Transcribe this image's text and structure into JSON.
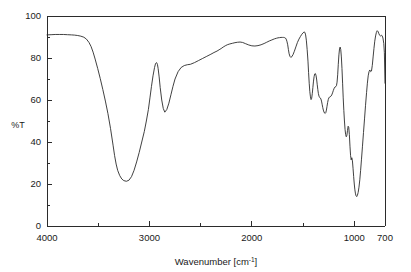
{
  "chart_data": {
    "type": "line",
    "title": "",
    "xlabel": "Wavenumber [cm⁻¹]",
    "ylabel": "%T",
    "xlabel_base": "Wavenumber [cm",
    "xlabel_sup": "-1",
    "xlabel_tail": "]",
    "xlim": [
      4000,
      700
    ],
    "ylim": [
      0,
      100
    ],
    "x_inverted": true,
    "grid": false,
    "legend": "none",
    "line_color": "#2b2b2b",
    "background_color": "#ffffff",
    "xticks": [
      4000,
      3000,
      2000,
      1000,
      700
    ],
    "xtick_labels": [
      "4000",
      "3000",
      "2000",
      "1000",
      "700"
    ],
    "x_minor_ticks": [
      3500,
      2500,
      1500
    ],
    "yticks": [
      0,
      20,
      40,
      60,
      80,
      100
    ],
    "ytick_labels": [
      "0",
      "20",
      "40",
      "60",
      "80",
      "100"
    ],
    "y_minor_ticks": [
      10,
      30,
      50,
      70,
      90
    ],
    "series": [
      {
        "name": "Transmittance",
        "x": [
          4000,
          3960,
          3920,
          3880,
          3840,
          3800,
          3760,
          3730,
          3700,
          3670,
          3640,
          3615,
          3590,
          3570,
          3550,
          3530,
          3505,
          3480,
          3455,
          3430,
          3405,
          3380,
          3355,
          3340,
          3325,
          3310,
          3290,
          3270,
          3250,
          3225,
          3200,
          3175,
          3150,
          3125,
          3100,
          3075,
          3050,
          3030,
          3010,
          2995,
          2980,
          2965,
          2950,
          2940,
          2930,
          2922,
          2915,
          2905,
          2895,
          2880,
          2865,
          2850,
          2830,
          2810,
          2790,
          2770,
          2750,
          2720,
          2690,
          2660,
          2630,
          2600,
          2560,
          2520,
          2480,
          2440,
          2400,
          2370,
          2340,
          2320,
          2300,
          2280,
          2260,
          2240,
          2215,
          2190,
          2165,
          2140,
          2115,
          2090,
          2060,
          2030,
          2000,
          1970,
          1940,
          1910,
          1880,
          1855,
          1830,
          1805,
          1780,
          1760,
          1745,
          1730,
          1715,
          1700,
          1690,
          1680,
          1672,
          1665,
          1658,
          1650,
          1643,
          1636,
          1628,
          1620,
          1610,
          1598,
          1585,
          1570,
          1555,
          1540,
          1525,
          1512,
          1500,
          1490,
          1482,
          1475,
          1468,
          1460,
          1452,
          1446,
          1440,
          1434,
          1428,
          1422,
          1416,
          1410,
          1404,
          1398,
          1392,
          1386,
          1380,
          1374,
          1368,
          1362,
          1356,
          1350,
          1344,
          1338,
          1332,
          1326,
          1320,
          1314,
          1308,
          1302,
          1296,
          1290,
          1284,
          1278,
          1272,
          1266,
          1260,
          1254,
          1248,
          1242,
          1236,
          1228,
          1220,
          1212,
          1204,
          1196,
          1188,
          1180,
          1174,
          1168,
          1162,
          1156,
          1150,
          1144,
          1138,
          1132,
          1126,
          1120,
          1114,
          1108,
          1102,
          1096,
          1090,
          1084,
          1078,
          1072,
          1066,
          1060,
          1054,
          1048,
          1042,
          1036,
          1030,
          1024,
          1018,
          1012,
          1006,
          1000,
          994,
          988,
          982,
          976,
          970,
          962,
          954,
          946,
          938,
          930,
          920,
          910,
          900,
          890,
          880,
          872,
          864,
          856,
          848,
          840,
          832,
          824,
          816,
          808,
          800,
          792,
          784,
          776,
          768,
          760,
          752,
          744,
          736,
          728,
          720,
          712,
          706,
          700
        ],
        "y": [
          91.0,
          91.1,
          91.2,
          91.2,
          91.2,
          91.1,
          91.0,
          90.9,
          90.7,
          90.4,
          89.9,
          89.0,
          87.4,
          85.5,
          82.8,
          79.5,
          75.0,
          70.2,
          65.0,
          59.5,
          53.5,
          46.5,
          38.5,
          33.5,
          29.5,
          26.5,
          24.0,
          22.4,
          21.6,
          21.3,
          21.8,
          23.5,
          26.5,
          30.5,
          35.0,
          40.0,
          45.0,
          50.0,
          55.5,
          61.0,
          66.5,
          71.5,
          75.5,
          77.4,
          77.8,
          77.0,
          75.0,
          71.0,
          66.0,
          60.0,
          56.0,
          54.2,
          55.5,
          58.5,
          62.5,
          66.5,
          70.0,
          73.5,
          75.5,
          76.4,
          76.8,
          77.0,
          77.8,
          78.8,
          79.8,
          80.8,
          81.8,
          82.6,
          83.3,
          83.9,
          84.5,
          85.2,
          85.8,
          86.3,
          86.7,
          87.0,
          87.3,
          87.5,
          87.6,
          87.4,
          86.8,
          86.2,
          85.8,
          85.7,
          85.9,
          86.3,
          86.9,
          87.5,
          88.1,
          88.6,
          89.1,
          89.4,
          89.6,
          89.7,
          89.8,
          89.8,
          89.8,
          89.7,
          89.5,
          89.0,
          88.0,
          86.3,
          84.0,
          82.0,
          80.8,
          80.3,
          80.6,
          81.6,
          83.2,
          85.3,
          87.4,
          89.0,
          90.3,
          91.3,
          92.0,
          92.4,
          92.2,
          91.0,
          88.5,
          84.0,
          78.5,
          73.0,
          68.0,
          64.0,
          61.5,
          60.2,
          60.8,
          63.0,
          66.0,
          69.0,
          71.2,
          72.4,
          72.6,
          71.8,
          70.0,
          67.5,
          65.0,
          63.0,
          61.8,
          61.2,
          61.0,
          60.5,
          59.5,
          58.0,
          56.5,
          55.2,
          54.3,
          53.8,
          53.6,
          54.0,
          55.2,
          57.0,
          58.8,
          60.2,
          61.0,
          61.4,
          61.5,
          61.8,
          62.4,
          63.4,
          64.6,
          65.6,
          66.2,
          66.4,
          66.8,
          68.5,
          72.0,
          77.0,
          81.5,
          84.3,
          85.2,
          84.0,
          80.5,
          75.0,
          68.0,
          61.0,
          55.0,
          50.0,
          46.0,
          43.5,
          42.5,
          43.2,
          45.5,
          47.5,
          47.0,
          43.5,
          38.0,
          33.5,
          31.5,
          32.5,
          31.0,
          27.5,
          23.5,
          20.0,
          17.2,
          15.3,
          14.3,
          14.0,
          14.5,
          16.0,
          18.5,
          22.0,
          26.5,
          31.5,
          38.0,
          44.5,
          51.0,
          57.5,
          63.5,
          68.0,
          71.5,
          73.5,
          74.3,
          73.5,
          73.8,
          76.5,
          80.5,
          84.5,
          88.0,
          90.5,
          92.2,
          93.0,
          92.6,
          91.6,
          90.8,
          90.5,
          90.8,
          90.6,
          89.5,
          87.0,
          82.5,
          68.0
        ]
      }
    ],
    "annotations": [],
    "features": {
      "oh_stretch_min_wavenumber": 3250,
      "oh_stretch_min_transmittance": 21.3,
      "ch_stretch_min_wavenumber": 2850,
      "ch_stretch_min_transmittance": 54.2,
      "carbonyl_notch_wavenumber": 1650,
      "carbonyl_notch_transmittance": 80.3,
      "fingerprint_min_wavenumber": 1036,
      "fingerprint_min_transmittance": 14.0,
      "baseline_transmittance": 91.0
    }
  },
  "geometry": {
    "plot_left": 47,
    "plot_right": 385,
    "plot_top": 16,
    "plot_bottom": 226
  }
}
